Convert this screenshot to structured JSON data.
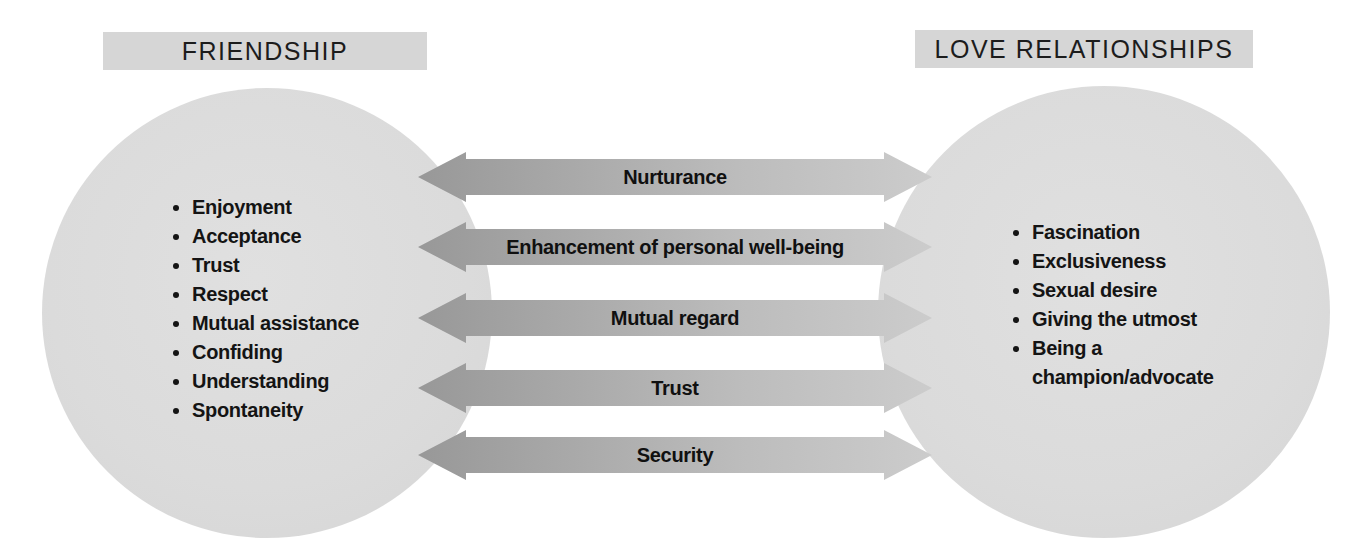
{
  "diagram": {
    "friendship": {
      "title": "FRIENDSHIP",
      "items": [
        "Enjoyment",
        "Acceptance",
        "Trust",
        "Respect",
        "Mutual assistance",
        "Confiding",
        "Understanding",
        "Spontaneity"
      ]
    },
    "love_relationships": {
      "title": "LOVE RELATIONSHIPS",
      "items": [
        "Fascination",
        "Exclusiveness",
        "Sexual desire",
        "Giving the utmost",
        "Being a champion/advocate"
      ]
    },
    "shared_qualities": [
      "Nurturance",
      "Enhancement of personal well-being",
      "Mutual regard",
      "Trust",
      "Security"
    ],
    "colors": {
      "circle_fill": "#dbdbdb",
      "title_box_fill": "#d6d6d6",
      "arrow_gradient_start": "#989898",
      "arrow_gradient_end": "#cccccc",
      "text": "#141414"
    }
  }
}
